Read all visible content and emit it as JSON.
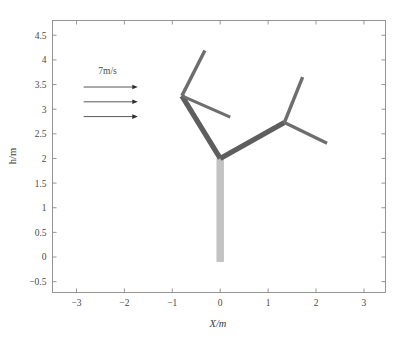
{
  "chart_data": {
    "type": "line",
    "title": "",
    "xlabel": "X/m",
    "ylabel": "h/m",
    "xlim": [
      -3.5,
      3.45
    ],
    "ylim": [
      -0.72,
      4.8
    ],
    "xticks": [
      -3,
      -2,
      -1,
      0,
      1,
      2,
      3
    ],
    "xticklabels": [
      "−3",
      "−2",
      "−1",
      "0",
      "1",
      "2",
      "3"
    ],
    "yticks": [
      -0.5,
      0,
      0.5,
      1,
      1.5,
      2,
      2.5,
      3,
      3.5,
      4,
      4.5
    ],
    "yticklabels": [
      "−0.5",
      "0",
      "0.5",
      "1",
      "1.5",
      "2",
      "2.5",
      "3",
      "3.5",
      "4",
      "4.5"
    ],
    "grid": false,
    "legend": "none",
    "annotations": [
      {
        "name": "wind-speed-label",
        "text": "7m/s",
        "x": -2.35,
        "y": 3.72
      }
    ],
    "wind_arrows": [
      {
        "x_start": -2.85,
        "x_end": -1.72,
        "y": 3.45
      },
      {
        "x_start": -2.85,
        "x_end": -1.72,
        "y": 3.15
      },
      {
        "x_start": -2.85,
        "x_end": -1.72,
        "y": 2.85
      }
    ],
    "series": [
      {
        "name": "trunk",
        "color": "#c3c3c3",
        "linewidth": 7.5,
        "points": [
          [
            0.0,
            -0.1
          ],
          [
            0.0,
            2.0
          ]
        ]
      },
      {
        "name": "left-main-branch",
        "color": "#5e5e5e",
        "linewidth": 5.2,
        "points": [
          [
            0.0,
            2.0
          ],
          [
            -0.8,
            3.27
          ]
        ]
      },
      {
        "name": "left-upper-branch",
        "color": "#6e6e6e",
        "linewidth": 3.4,
        "points": [
          [
            -0.8,
            3.27
          ],
          [
            -0.32,
            4.19
          ]
        ]
      },
      {
        "name": "left-lower-branch",
        "color": "#6e6e6e",
        "linewidth": 3.0,
        "points": [
          [
            -0.8,
            3.27
          ],
          [
            0.21,
            2.84
          ]
        ]
      },
      {
        "name": "right-main-branch",
        "color": "#5e5e5e",
        "linewidth": 5.2,
        "points": [
          [
            0.0,
            2.0
          ],
          [
            1.34,
            2.73
          ]
        ]
      },
      {
        "name": "right-upper-branch",
        "color": "#6e6e6e",
        "linewidth": 3.4,
        "points": [
          [
            1.34,
            2.73
          ],
          [
            1.72,
            3.65
          ]
        ]
      },
      {
        "name": "right-lower-branch",
        "color": "#6e6e6e",
        "linewidth": 3.2,
        "points": [
          [
            1.34,
            2.73
          ],
          [
            2.23,
            2.31
          ]
        ]
      }
    ]
  }
}
